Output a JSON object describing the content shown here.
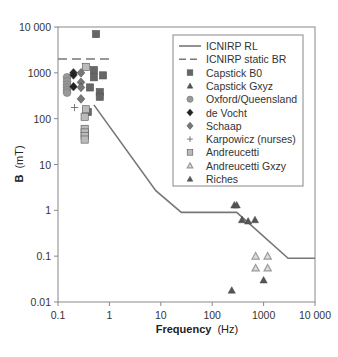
{
  "chart_data": {
    "type": "scatter",
    "title": "",
    "xlabel": "Frequency",
    "xlabel_unit": "(Hz)",
    "ylabel": "B",
    "ylabel_unit": "(mT)",
    "xscale": "log",
    "yscale": "log",
    "xlim": [
      0.1,
      10000
    ],
    "ylim": [
      0.01,
      10000
    ],
    "x_ticks": [
      "0.1",
      "1",
      "10",
      "100",
      "1000",
      "10 000"
    ],
    "y_ticks": [
      "0.01",
      "0.1",
      "1",
      "10",
      "100",
      "1000",
      "10 000"
    ],
    "grid": false,
    "legend_position": "upper right (inside)",
    "series": [
      {
        "name": "ICNIRP RL",
        "kind": "line",
        "style": "solid",
        "color": "#777777",
        "x": [
          0.5,
          8,
          25,
          300,
          3000,
          10000
        ],
        "y": [
          200,
          2.7,
          0.9,
          0.9,
          0.09,
          0.09
        ]
      },
      {
        "name": "ICNIRP static BR",
        "kind": "line",
        "style": "dashed",
        "color": "#777777",
        "x": [
          0.1,
          1
        ],
        "y": [
          2000,
          2000
        ]
      },
      {
        "name": "Capstick B0",
        "kind": "marker",
        "marker": "square",
        "color": "#666666",
        "x": [
          0.55,
          0.5,
          0.5,
          0.75,
          0.42,
          0.65,
          0.65,
          0.38
        ],
        "y": [
          7000,
          1150,
          800,
          880,
          480,
          380,
          300,
          140
        ]
      },
      {
        "name": "Capstick Gxyz",
        "kind": "marker",
        "marker": "triangle",
        "color": "#555555",
        "x": [
          270,
          300,
          380,
          500,
          680
        ],
        "y": [
          1.3,
          1.3,
          0.62,
          0.58,
          0.62
        ]
      },
      {
        "name": "Oxford/Queensland",
        "kind": "marker",
        "marker": "circle",
        "color": "#999999",
        "x": [
          0.15,
          0.15,
          0.15,
          0.15,
          0.15,
          0.15
        ],
        "y": [
          800,
          650,
          550,
          480,
          420,
          370
        ]
      },
      {
        "name": "de Vocht",
        "kind": "marker",
        "marker": "diamond",
        "color": "#222222",
        "x": [
          0.2,
          0.2,
          0.2
        ],
        "y": [
          1000,
          900,
          500
        ]
      },
      {
        "name": "Schaap",
        "kind": "marker",
        "marker": "diamond",
        "color": "#777777",
        "x": [
          0.28,
          0.28,
          0.28,
          0.28
        ],
        "y": [
          1000,
          620,
          480,
          270
        ]
      },
      {
        "name": "Karpowicz (nurses)",
        "kind": "marker",
        "marker": "plus",
        "color": "#777777",
        "x": [
          0.21
        ],
        "y": [
          175
        ]
      },
      {
        "name": "Andreucetti",
        "kind": "marker",
        "marker": "square",
        "color": "#bbbbbb",
        "x": [
          0.35,
          0.35,
          0.33,
          0.33,
          0.33,
          0.33,
          0.33
        ],
        "y": [
          1350,
          160,
          110,
          60,
          50,
          42,
          35
        ]
      },
      {
        "name": "Andreucetti Gxzy",
        "kind": "marker",
        "marker": "triangle-outline",
        "color": "#999999",
        "x": [
          700,
          1200,
          700,
          1200
        ],
        "y": [
          0.1,
          0.1,
          0.055,
          0.055
        ]
      },
      {
        "name": "Riches",
        "kind": "marker",
        "marker": "triangle",
        "color": "#555555",
        "x": [
          1000,
          240
        ],
        "y": [
          0.03,
          0.018
        ]
      }
    ],
    "legend": [
      "ICNIRP RL",
      "ICNIRP static BR",
      "Capstick B0",
      "Capstick Gxyz",
      "Oxford/Queensland",
      "de Vocht",
      "Schaap",
      "Karpowicz (nurses)",
      "Andreucetti",
      "Andreucetti Gxzy",
      "Riches"
    ]
  },
  "layout": {
    "plot": {
      "left": 58,
      "right": 315,
      "top": 27,
      "bottom": 302
    },
    "legend_box": {
      "left": 173,
      "top": 35,
      "width": 130,
      "height": 151
    }
  }
}
